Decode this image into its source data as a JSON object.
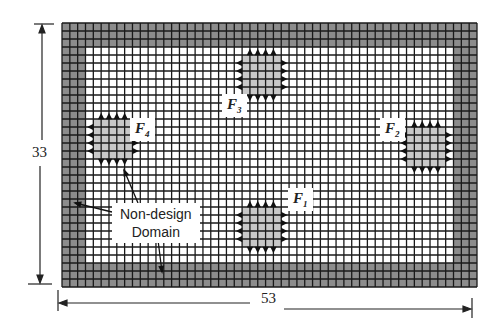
{
  "diagram": {
    "mesh": {
      "cols": 53,
      "rows": 33,
      "non_design_thickness_cells": 3
    },
    "dimensions": {
      "width_label": "53",
      "height_label": "33"
    },
    "annotation": {
      "line1": "Non-design",
      "line2": "Domain"
    },
    "loads": [
      {
        "id": "F1",
        "label": "F",
        "sub": "1",
        "col": 23,
        "row": 23,
        "size": 5
      },
      {
        "id": "F2",
        "label": "F",
        "sub": "2",
        "col": 44,
        "row": 13,
        "size": 5
      },
      {
        "id": "F3",
        "label": "F",
        "sub": "3",
        "col": 23,
        "row": 4,
        "size": 5
      },
      {
        "id": "F4",
        "label": "F",
        "sub": "4",
        "col": 4,
        "row": 12,
        "size": 5
      }
    ],
    "colors": {
      "grid": "#1a1a1a",
      "non_design": "#8c8c8c",
      "load_patch": "#c8c8c8",
      "background": "#ffffff"
    }
  }
}
